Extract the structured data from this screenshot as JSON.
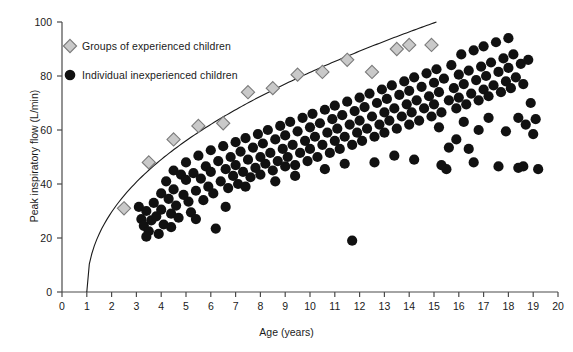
{
  "chart_data": {
    "type": "scatter",
    "title": "",
    "xlabel": "Age (years)",
    "ylabel": "Peak inspiratory flow (L/min)",
    "xlim": [
      0,
      20
    ],
    "ylim": [
      0,
      100
    ],
    "xticks": [
      0,
      1,
      2,
      3,
      4,
      5,
      6,
      7,
      8,
      9,
      10,
      11,
      12,
      13,
      14,
      15,
      16,
      17,
      18,
      19,
      20
    ],
    "yticks": [
      0,
      20,
      40,
      60,
      80,
      100
    ],
    "grid": false,
    "legend_position": "upper-left",
    "series": [
      {
        "name": "Groups of experienced children",
        "marker": "diamond",
        "color": "#c9c9c9",
        "edge_color": "#7a7a7a",
        "points": [
          [
            2.5,
            31.0
          ],
          [
            3.5,
            48.0
          ],
          [
            4.5,
            56.5
          ],
          [
            5.5,
            61.5
          ],
          [
            6.5,
            62.5
          ],
          [
            7.5,
            74.0
          ],
          [
            8.5,
            75.5
          ],
          [
            9.5,
            80.5
          ],
          [
            10.5,
            81.5
          ],
          [
            11.5,
            86.0
          ],
          [
            12.5,
            81.5
          ],
          [
            13.5,
            90.0
          ],
          [
            14.0,
            91.5
          ],
          [
            14.9,
            91.5
          ]
        ]
      },
      {
        "name": "Individual inexperienced children",
        "marker": "circle",
        "color": "#111111",
        "points": [
          [
            3.1,
            31.5
          ],
          [
            3.2,
            27.0
          ],
          [
            3.3,
            24.5
          ],
          [
            3.4,
            30.0
          ],
          [
            3.5,
            22.5
          ],
          [
            3.6,
            26.5
          ],
          [
            3.7,
            33.0
          ],
          [
            3.8,
            28.0
          ],
          [
            3.9,
            21.5
          ],
          [
            4.0,
            36.5
          ],
          [
            4.0,
            30.5
          ],
          [
            4.1,
            25.0
          ],
          [
            4.2,
            41.0
          ],
          [
            4.3,
            34.5
          ],
          [
            4.4,
            29.0
          ],
          [
            4.5,
            45.0
          ],
          [
            4.5,
            38.0
          ],
          [
            4.6,
            32.0
          ],
          [
            4.7,
            27.5
          ],
          [
            4.8,
            43.5
          ],
          [
            4.9,
            36.0
          ],
          [
            5.0,
            48.0
          ],
          [
            5.0,
            41.5
          ],
          [
            5.1,
            33.5
          ],
          [
            5.2,
            29.5
          ],
          [
            5.3,
            44.0
          ],
          [
            5.4,
            37.5
          ],
          [
            5.5,
            50.5
          ],
          [
            5.6,
            42.0
          ],
          [
            5.7,
            34.0
          ],
          [
            5.8,
            46.5
          ],
          [
            5.9,
            39.0
          ],
          [
            6.0,
            52.5
          ],
          [
            6.0,
            44.5
          ],
          [
            6.1,
            36.5
          ],
          [
            6.2,
            23.5
          ],
          [
            6.3,
            48.5
          ],
          [
            6.4,
            41.0
          ],
          [
            6.5,
            54.0
          ],
          [
            6.6,
            45.5
          ],
          [
            6.7,
            38.5
          ],
          [
            6.8,
            50.0
          ],
          [
            6.9,
            43.0
          ],
          [
            7.0,
            55.5
          ],
          [
            7.0,
            47.0
          ],
          [
            7.1,
            40.0
          ],
          [
            7.2,
            52.0
          ],
          [
            7.3,
            44.5
          ],
          [
            7.4,
            57.0
          ],
          [
            7.5,
            49.0
          ],
          [
            7.6,
            42.5
          ],
          [
            7.7,
            53.5
          ],
          [
            7.8,
            46.0
          ],
          [
            7.9,
            58.5
          ],
          [
            8.0,
            50.0
          ],
          [
            8.0,
            43.5
          ],
          [
            8.1,
            55.0
          ],
          [
            8.2,
            47.5
          ],
          [
            8.3,
            60.0
          ],
          [
            8.4,
            51.5
          ],
          [
            8.5,
            45.0
          ],
          [
            8.6,
            56.5
          ],
          [
            8.7,
            48.5
          ],
          [
            8.8,
            61.5
          ],
          [
            8.9,
            53.0
          ],
          [
            9.0,
            46.5
          ],
          [
            9.0,
            58.0
          ],
          [
            9.1,
            50.0
          ],
          [
            9.2,
            63.0
          ],
          [
            9.3,
            54.5
          ],
          [
            9.4,
            47.0
          ],
          [
            9.5,
            59.5
          ],
          [
            9.6,
            51.5
          ],
          [
            9.7,
            64.5
          ],
          [
            9.8,
            56.0
          ],
          [
            9.9,
            48.5
          ],
          [
            10.0,
            61.0
          ],
          [
            10.0,
            53.0
          ],
          [
            10.1,
            66.0
          ],
          [
            10.2,
            57.5
          ],
          [
            10.3,
            50.0
          ],
          [
            10.4,
            62.5
          ],
          [
            10.5,
            54.5
          ],
          [
            10.6,
            67.5
          ],
          [
            10.7,
            59.0
          ],
          [
            10.8,
            51.5
          ],
          [
            10.9,
            64.0
          ],
          [
            11.0,
            56.0
          ],
          [
            11.0,
            69.0
          ],
          [
            11.1,
            60.5
          ],
          [
            11.2,
            53.0
          ],
          [
            11.3,
            65.5
          ],
          [
            11.4,
            57.5
          ],
          [
            11.5,
            70.5
          ],
          [
            11.6,
            62.0
          ],
          [
            11.7,
            54.5
          ],
          [
            11.7,
            19.0
          ],
          [
            11.8,
            67.0
          ],
          [
            11.9,
            59.0
          ],
          [
            12.0,
            72.0
          ],
          [
            12.0,
            63.5
          ],
          [
            12.1,
            56.0
          ],
          [
            12.2,
            68.5
          ],
          [
            12.3,
            60.5
          ],
          [
            12.4,
            73.5
          ],
          [
            12.5,
            65.0
          ],
          [
            12.6,
            57.5
          ],
          [
            12.7,
            70.0
          ],
          [
            12.8,
            62.0
          ],
          [
            12.9,
            75.0
          ],
          [
            13.0,
            66.5
          ],
          [
            13.0,
            59.0
          ],
          [
            13.1,
            71.5
          ],
          [
            13.2,
            63.5
          ],
          [
            13.3,
            76.5
          ],
          [
            13.4,
            68.0
          ],
          [
            13.5,
            60.5
          ],
          [
            13.6,
            73.0
          ],
          [
            13.7,
            65.0
          ],
          [
            13.8,
            78.0
          ],
          [
            13.9,
            69.5
          ],
          [
            14.0,
            62.0
          ],
          [
            14.0,
            74.5
          ],
          [
            14.1,
            66.5
          ],
          [
            14.2,
            79.5
          ],
          [
            14.3,
            71.0
          ],
          [
            14.4,
            63.5
          ],
          [
            14.5,
            76.0
          ],
          [
            14.6,
            68.0
          ],
          [
            14.7,
            81.0
          ],
          [
            14.8,
            72.5
          ],
          [
            14.9,
            65.0
          ],
          [
            15.0,
            77.5
          ],
          [
            15.0,
            69.5
          ],
          [
            15.1,
            82.5
          ],
          [
            15.2,
            74.0
          ],
          [
            15.3,
            66.5
          ],
          [
            15.4,
            79.0
          ],
          [
            15.5,
            45.5
          ],
          [
            15.6,
            71.0
          ],
          [
            15.7,
            84.0
          ],
          [
            15.8,
            75.5
          ],
          [
            15.9,
            68.0
          ],
          [
            16.0,
            80.5
          ],
          [
            16.0,
            72.0
          ],
          [
            16.1,
            88.0
          ],
          [
            16.2,
            77.0
          ],
          [
            16.3,
            69.5
          ],
          [
            16.4,
            82.0
          ],
          [
            16.5,
            73.5
          ],
          [
            16.6,
            89.5
          ],
          [
            16.7,
            78.5
          ],
          [
            16.8,
            71.0
          ],
          [
            16.9,
            83.5
          ],
          [
            17.0,
            75.0
          ],
          [
            17.0,
            91.0
          ],
          [
            17.1,
            80.0
          ],
          [
            17.2,
            72.5
          ],
          [
            17.3,
            85.0
          ],
          [
            17.4,
            76.5
          ],
          [
            17.5,
            92.5
          ],
          [
            17.6,
            81.5
          ],
          [
            17.7,
            74.0
          ],
          [
            17.8,
            86.5
          ],
          [
            17.9,
            78.0
          ],
          [
            18.0,
            94.0
          ],
          [
            18.0,
            83.0
          ],
          [
            18.1,
            75.5
          ],
          [
            18.2,
            88.0
          ],
          [
            18.3,
            79.5
          ],
          [
            18.4,
            64.5
          ],
          [
            18.5,
            84.5
          ],
          [
            18.6,
            77.0
          ],
          [
            18.7,
            62.0
          ],
          [
            18.8,
            86.0
          ],
          [
            18.9,
            70.0
          ],
          [
            19.0,
            58.5
          ],
          [
            19.1,
            64.0
          ],
          [
            19.2,
            45.5
          ],
          [
            18.4,
            46.0
          ],
          [
            17.6,
            46.5
          ],
          [
            16.4,
            53.0
          ],
          [
            15.6,
            53.5
          ],
          [
            15.3,
            47.0
          ],
          [
            16.8,
            60.0
          ],
          [
            17.9,
            59.5
          ],
          [
            16.2,
            63.0
          ],
          [
            15.9,
            56.5
          ],
          [
            17.2,
            64.5
          ],
          [
            18.6,
            46.5
          ],
          [
            16.6,
            48.0
          ],
          [
            15.2,
            61.0
          ],
          [
            14.2,
            49.0
          ],
          [
            13.4,
            50.5
          ],
          [
            12.6,
            48.0
          ],
          [
            11.4,
            47.5
          ],
          [
            10.6,
            45.5
          ],
          [
            9.4,
            43.0
          ],
          [
            8.6,
            41.0
          ],
          [
            7.4,
            39.0
          ],
          [
            6.6,
            31.5
          ],
          [
            5.4,
            27.0
          ],
          [
            4.4,
            24.0
          ],
          [
            3.4,
            20.5
          ]
        ]
      }
    ],
    "reference_curve": {
      "name": "upper-boundary-curve",
      "color": "#1a1a1a",
      "x_start": 1.0,
      "x_end": 15.1,
      "y_start": 0,
      "y_end": 100,
      "description": "Smooth concave curve rising from (1,0) to about (15,100)"
    }
  },
  "legend": {
    "entries": [
      {
        "label": "Groups of experienced children",
        "marker": "diamond"
      },
      {
        "label": "Individual inexperienced children",
        "marker": "circle"
      }
    ]
  }
}
